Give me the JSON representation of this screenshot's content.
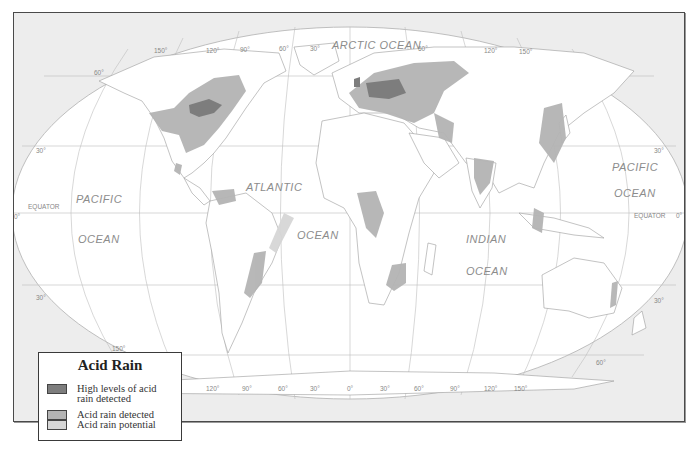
{
  "map": {
    "title": "Acid Rain",
    "projection": "Robinson-style world map",
    "ocean_labels": {
      "arctic": "ARCTIC OCEAN",
      "pacific_west_1": "PACIFIC",
      "pacific_west_2": "OCEAN",
      "atlantic_1": "ATLANTIC",
      "atlantic_2": "OCEAN",
      "indian_1": "INDIAN",
      "indian_2": "OCEAN",
      "pacific_east_1": "PACIFIC",
      "pacific_east_2": "OCEAN"
    },
    "equator_label": "EQUATOR",
    "latitude_labels": {
      "lat60n": "60°",
      "lat30n": "30°",
      "lat0": "0°",
      "lat30s": "30°",
      "lat60s": "60°",
      "lat30n_east": "30°",
      "lat30s_east": "30°",
      "lat0_east": "0°"
    },
    "longitude_labels_top": [
      "150°",
      "120°",
      "90°",
      "60°",
      "30°",
      "60°",
      "120°",
      "150°"
    ],
    "longitude_labels_bottom": [
      "150°",
      "120°",
      "90°",
      "60°",
      "30°",
      "0°",
      "30°",
      "60°",
      "90°",
      "120°",
      "150°"
    ],
    "colors": {
      "background": "#ededed",
      "land": "#ffffff",
      "grid": "#b5b5b5",
      "high": "#7d7d7d",
      "detected": "#b4b4b4",
      "potential": "#d6d6d6"
    }
  },
  "legend": {
    "title": "Acid Rain",
    "items": [
      {
        "label_line1": "High levels of acid",
        "label_line2": "rain detected",
        "color": "#7d7d7d"
      },
      {
        "label_line1": "Acid rain detected",
        "label_line2": "",
        "color": "#b4b4b4"
      },
      {
        "label_line1": "Acid rain potential",
        "label_line2": "",
        "color": "#d6d6d6"
      }
    ]
  }
}
